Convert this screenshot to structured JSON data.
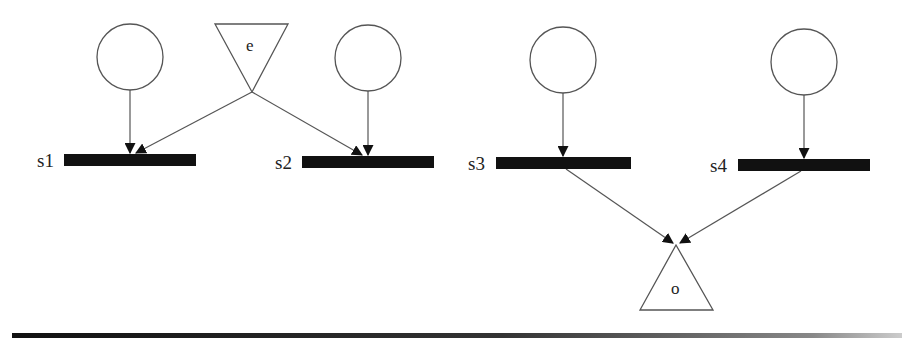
{
  "diagram": {
    "type": "petri-net",
    "colors": {
      "stroke": "#555555",
      "bar": "#111111",
      "background": "#ffffff"
    },
    "places": [
      {
        "id": "p1",
        "cx": 130,
        "cy": 57,
        "r": 33
      },
      {
        "id": "p2",
        "cx": 368,
        "cy": 58,
        "r": 33
      },
      {
        "id": "p3",
        "cx": 563,
        "cy": 60,
        "r": 33
      },
      {
        "id": "p4",
        "cx": 804,
        "cy": 62,
        "r": 33
      }
    ],
    "transitions": [
      {
        "id": "s1",
        "label": "s1",
        "x": 64,
        "y": 154,
        "w": 132,
        "h": 12
      },
      {
        "id": "s2",
        "label": "s2",
        "x": 302,
        "y": 156,
        "w": 132,
        "h": 12
      },
      {
        "id": "s3",
        "label": "s3",
        "x": 496,
        "y": 157,
        "w": 135,
        "h": 12
      },
      {
        "id": "s4",
        "label": "s4",
        "x": 738,
        "y": 159,
        "w": 132,
        "h": 12
      }
    ],
    "input_port": {
      "id": "e",
      "label": "e",
      "orientation": "down"
    },
    "output_port": {
      "id": "o",
      "label": "o",
      "orientation": "up"
    },
    "arcs": [
      {
        "from": "p1",
        "to": "s1"
      },
      {
        "from": "e",
        "to": "s1"
      },
      {
        "from": "e",
        "to": "s2"
      },
      {
        "from": "p2",
        "to": "s2"
      },
      {
        "from": "p3",
        "to": "s3"
      },
      {
        "from": "p4",
        "to": "s4"
      },
      {
        "from": "s3",
        "to": "o"
      },
      {
        "from": "s4",
        "to": "o"
      }
    ]
  }
}
